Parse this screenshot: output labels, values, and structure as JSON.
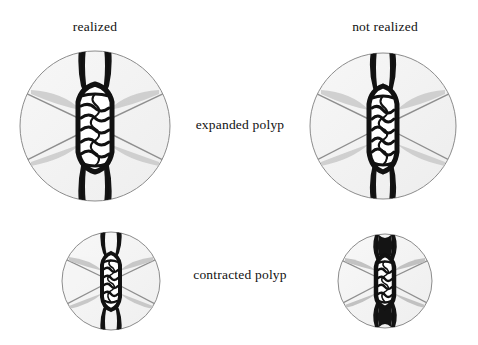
{
  "figure": {
    "type": "diagram",
    "background_color": "#ffffff",
    "columns": [
      {
        "id": "realized",
        "label": "realized"
      },
      {
        "id": "not_realized",
        "label": "not realized"
      }
    ],
    "rows": [
      {
        "id": "expanded",
        "label": "expanded polyp"
      },
      {
        "id": "contracted",
        "label": "contracted polyp"
      }
    ],
    "colors": {
      "outline": "#111111",
      "disc_fill": "#f4f4f4",
      "disc_stroke": "#8c8c8c",
      "spoke": "#8f8f8f",
      "tentacle_shadow": "#c9c9c9",
      "mesentery_black": "#141414",
      "lumen_white": "#ffffff"
    },
    "panels": [
      {
        "id": "expanded_realized",
        "row": "expanded",
        "column": "realized",
        "center_x": 95,
        "center_y": 126,
        "radius": 75,
        "column_width": 26,
        "column_style": "wide",
        "septa_count": 7,
        "lobe_weight": "light",
        "spoke_count": 4
      },
      {
        "id": "expanded_not_realized",
        "row": "expanded",
        "column": "not_realized",
        "center_x": 383,
        "center_y": 126,
        "radius": 73,
        "column_width": 22,
        "column_style": "narrow",
        "septa_count": 7,
        "lobe_weight": "medium",
        "spoke_count": 4
      },
      {
        "id": "contracted_realized",
        "row": "contracted",
        "column": "realized",
        "center_x": 111,
        "center_y": 281,
        "radius": 49,
        "column_width": 16,
        "column_style": "narrow",
        "septa_count": 6,
        "lobe_weight": "medium",
        "spoke_count": 4
      },
      {
        "id": "contracted_not_realized",
        "row": "contracted",
        "column": "not_realized",
        "center_x": 385,
        "center_y": 281,
        "radius": 47,
        "column_width": 18,
        "column_style": "narrow",
        "septa_count": 6,
        "lobe_weight": "heavy",
        "spoke_count": 4
      }
    ]
  }
}
